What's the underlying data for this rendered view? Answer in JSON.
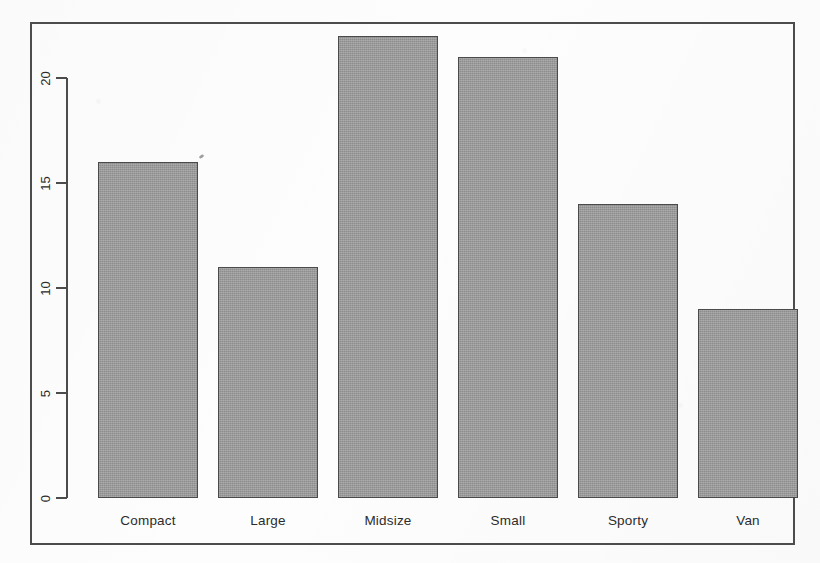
{
  "chart_data": {
    "type": "bar",
    "title": "",
    "subtitle": "",
    "xlabel": "",
    "ylabel": "",
    "categories": [
      "Compact",
      "Large",
      "Midsize",
      "Small",
      "Sporty",
      "Van"
    ],
    "values": [
      16,
      11,
      22,
      21,
      14,
      9
    ],
    "series": [
      {
        "name": "Count",
        "values": [
          16,
          11,
          22,
          21,
          14,
          9
        ]
      }
    ],
    "ylim": [
      0,
      22
    ],
    "y_axis_ticks": [
      0,
      5,
      10,
      15,
      20
    ],
    "y_tick_labels": [
      "0",
      "5",
      "10",
      "15",
      "20"
    ],
    "x_tick_labels": [
      "Compact",
      "Large",
      "Midsize",
      "Small",
      "Sporty",
      "Van"
    ],
    "grid": false,
    "legend": false,
    "legend_position": "none",
    "bar_fill_color": "#9a9a9a",
    "bar_border_color": "#4a4a4a",
    "axis_color": "#4c4c4c",
    "background_color": "#fdfdfd",
    "frame_box": true,
    "y_label_rotation": "vertical",
    "annotations": []
  },
  "figure": {
    "frame_border_color": "#4c4c4c"
  }
}
